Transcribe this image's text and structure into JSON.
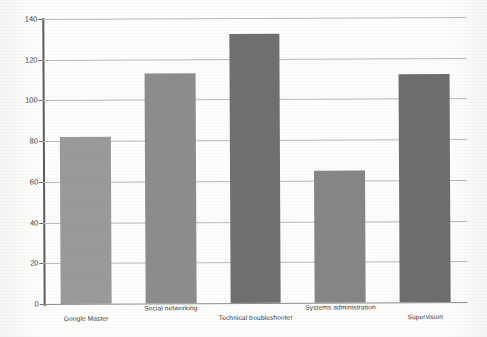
{
  "chart_data": {
    "type": "bar",
    "title": "",
    "xlabel": "",
    "ylabel": "",
    "ylim": [
      0,
      140
    ],
    "ytick_interval": 20,
    "yticks": [
      0,
      20,
      40,
      60,
      80,
      100,
      120,
      140
    ],
    "ytick_labels": [
      "0",
      "20",
      "40",
      "60",
      "80",
      "100",
      "120",
      "140"
    ],
    "grid": true,
    "grid_axis": "y",
    "legend": "none",
    "categories": [
      "Google Master",
      "Social networking",
      "Technical troubleshooter",
      "Systems administration",
      "Supervision"
    ],
    "values": [
      82,
      113,
      132,
      65,
      112
    ],
    "bar_colors": [
      "#9a9a9a",
      "#8d8d8d",
      "#707070",
      "#868686",
      "#6e6e6e"
    ],
    "bar_width_ratio": 0.6
  },
  "axes": {
    "y_tick_labels": [
      "140",
      "120",
      "100",
      "80",
      "60",
      "40",
      "20",
      "0"
    ]
  },
  "colors": {
    "background": "#ffffff",
    "gridline": "#b9b9b9",
    "axis": "#5d5d5d",
    "text": "#3a3a3a"
  }
}
